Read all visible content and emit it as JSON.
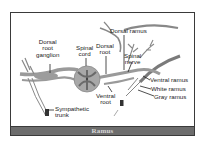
{
  "figure": {
    "caption": "Ramus",
    "labels": {
      "dorsal_root_ganglion": [
        "Dorsal",
        "root",
        "ganglion"
      ],
      "spinal_cord": [
        "Spinal",
        "cord"
      ],
      "dorsal_root": [
        "Dorsal",
        "root"
      ],
      "dorsal_ramus": "Dorsal ramus",
      "spinal_nerve": [
        "Spinal",
        "nerve"
      ],
      "ventral_ramus": "Ventral ramus",
      "white_ramus": "White ramus",
      "gray_ramus": "Gray ramus",
      "ventral_root": [
        "Ventral",
        "root"
      ],
      "sympathetic_trunk": [
        "Sympathetic",
        "trunk"
      ]
    },
    "colors": {
      "frame": "#3a3a3a",
      "nerve_fill": "#9a9a9a",
      "cord_fill": "#a8a8a8",
      "gray_matter": "#6a6a6a",
      "caption_bg": "#6d6d6d",
      "caption_text": "#d8d8d8"
    }
  }
}
